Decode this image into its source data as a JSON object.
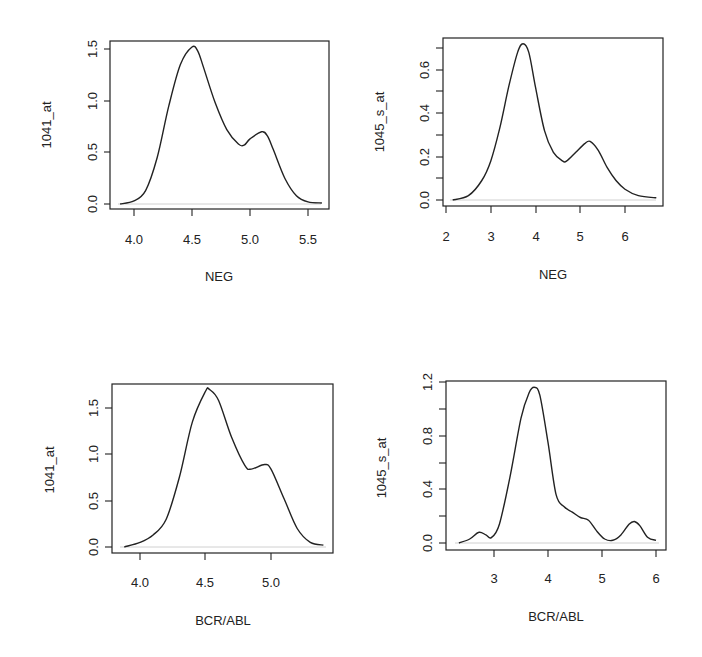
{
  "chart_data": [
    {
      "type": "line",
      "title": "",
      "xlabel": "NEG",
      "ylabel": "1041_at",
      "xlim": [
        3.85,
        5.65
      ],
      "ylim": [
        0,
        1.55
      ],
      "x_ticks": [
        "4.0",
        "4.5",
        "5.0",
        "5.5"
      ],
      "y_ticks": [
        "0.0",
        "0.5",
        "1.0",
        "1.5"
      ],
      "grid": false,
      "x": [
        3.88,
        4.0,
        4.1,
        4.2,
        4.3,
        4.4,
        4.5,
        4.55,
        4.6,
        4.7,
        4.8,
        4.9,
        4.95,
        5.0,
        5.1,
        5.15,
        5.2,
        5.3,
        5.4,
        5.5,
        5.62
      ],
      "values": [
        0.0,
        0.03,
        0.13,
        0.45,
        0.95,
        1.35,
        1.52,
        1.48,
        1.32,
        0.98,
        0.72,
        0.58,
        0.57,
        0.63,
        0.7,
        0.66,
        0.53,
        0.25,
        0.08,
        0.02,
        0.01
      ]
    },
    {
      "type": "line",
      "title": "",
      "xlabel": "NEG",
      "ylabel": "1045_s_at",
      "xlim": [
        2.0,
        6.7
      ],
      "ylim": [
        0,
        0.7
      ],
      "x_ticks": [
        "2",
        "3",
        "4",
        "5",
        "6"
      ],
      "y_ticks": [
        "0.0",
        "0.2",
        "0.4",
        "0.6"
      ],
      "grid": false,
      "x": [
        2.15,
        2.5,
        2.8,
        3.0,
        3.2,
        3.4,
        3.6,
        3.72,
        3.85,
        4.0,
        4.2,
        4.4,
        4.6,
        4.7,
        4.9,
        5.1,
        5.22,
        5.4,
        5.6,
        5.8,
        6.0,
        6.3,
        6.7
      ],
      "values": [
        0.0,
        0.02,
        0.09,
        0.18,
        0.33,
        0.52,
        0.68,
        0.72,
        0.68,
        0.52,
        0.32,
        0.22,
        0.18,
        0.18,
        0.22,
        0.26,
        0.27,
        0.23,
        0.15,
        0.09,
        0.05,
        0.02,
        0.01
      ]
    },
    {
      "type": "line",
      "title": "",
      "xlabel": "BCR/ABL",
      "ylabel": "1041_at",
      "xlim": [
        3.83,
        5.45
      ],
      "ylim": [
        0,
        1.75
      ],
      "x_ticks": [
        "4.0",
        "4.5",
        "5.0"
      ],
      "y_ticks": [
        "0.0",
        "0.5",
        "1.0",
        "1.5"
      ],
      "grid": false,
      "x": [
        3.88,
        4.0,
        4.1,
        4.2,
        4.3,
        4.4,
        4.5,
        4.53,
        4.6,
        4.7,
        4.8,
        4.85,
        4.95,
        5.0,
        5.1,
        5.2,
        5.3,
        5.4
      ],
      "values": [
        0.0,
        0.05,
        0.13,
        0.3,
        0.75,
        1.35,
        1.68,
        1.7,
        1.58,
        1.18,
        0.88,
        0.84,
        0.89,
        0.84,
        0.52,
        0.2,
        0.05,
        0.02
      ]
    },
    {
      "type": "line",
      "title": "",
      "xlabel": "BCR/ABL",
      "ylabel": "1045_s_at",
      "xlim": [
        2.2,
        6.2
      ],
      "ylim": [
        0,
        1.2
      ],
      "x_ticks": [
        "3",
        "4",
        "5",
        "6"
      ],
      "y_ticks": [
        "0.0",
        "0.4",
        "0.8",
        "1.2"
      ],
      "grid": false,
      "x": [
        2.35,
        2.55,
        2.72,
        2.85,
        2.95,
        3.1,
        3.3,
        3.5,
        3.65,
        3.75,
        3.85,
        4.0,
        4.15,
        4.3,
        4.45,
        4.6,
        4.75,
        4.9,
        5.05,
        5.2,
        5.35,
        5.5,
        5.6,
        5.7,
        5.85,
        6.0
      ],
      "values": [
        0.0,
        0.03,
        0.08,
        0.06,
        0.04,
        0.14,
        0.5,
        0.93,
        1.12,
        1.16,
        1.1,
        0.75,
        0.36,
        0.27,
        0.23,
        0.19,
        0.17,
        0.09,
        0.03,
        0.02,
        0.06,
        0.14,
        0.16,
        0.13,
        0.04,
        0.02
      ]
    }
  ],
  "panels": [
    {
      "xlabel": "NEG",
      "ylabel": "1041_at",
      "xticks": [
        "4.0",
        "4.5",
        "5.0",
        "5.5"
      ],
      "yticks": [
        "0.0",
        "0.5",
        "1.0",
        "1.5"
      ]
    },
    {
      "xlabel": "NEG",
      "ylabel": "1045_s_at",
      "xticks": [
        "2",
        "3",
        "4",
        "5",
        "6"
      ],
      "yticks": [
        "0.0",
        "0.2",
        "0.4",
        "0.6"
      ]
    },
    {
      "xlabel": "BCR/ABL",
      "ylabel": "1041_at",
      "xticks": [
        "4.0",
        "4.5",
        "5.0"
      ],
      "yticks": [
        "0.0",
        "0.5",
        "1.0",
        "1.5"
      ]
    },
    {
      "xlabel": "BCR/ABL",
      "ylabel": "1045_s_at",
      "xticks": [
        "3",
        "4",
        "5",
        "6"
      ],
      "yticks": [
        "0.0",
        "0.4",
        "0.8",
        "1.2"
      ]
    }
  ]
}
